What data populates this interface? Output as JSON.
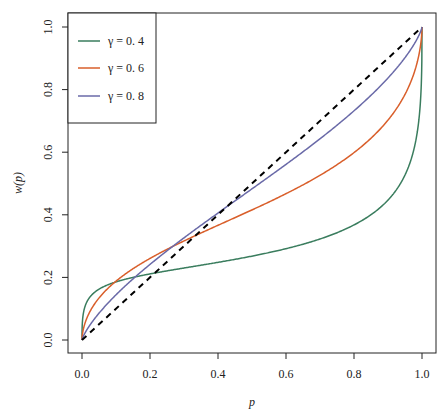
{
  "chart_data": {
    "type": "line",
    "title": "",
    "xlabel": "p",
    "ylabel": "w(p)",
    "xlim": [
      0,
      1
    ],
    "ylim": [
      0,
      1
    ],
    "grid": false,
    "legend_position": "top-left",
    "x_ticks": [
      "0.0",
      "0.2",
      "0.4",
      "0.6",
      "0.8",
      "1.0"
    ],
    "y_ticks": [
      "0.0",
      "0.2",
      "0.4",
      "0.6",
      "0.8",
      "1.0"
    ],
    "x": [
      0,
      0.01,
      0.02,
      0.05,
      0.1,
      0.15,
      0.2,
      0.3,
      0.4,
      0.5,
      0.6,
      0.7,
      0.8,
      0.9,
      0.95,
      0.98,
      0.99,
      1.0
    ],
    "series": [
      {
        "name": "γ = 0. 4",
        "color": "#3a7d5e",
        "style": "solid",
        "values": [
          0,
          0.111,
          0.132,
          0.162,
          0.186,
          0.2,
          0.211,
          0.23,
          0.248,
          0.268,
          0.292,
          0.323,
          0.368,
          0.447,
          0.527,
          0.627,
          0.696,
          1.0
        ]
      },
      {
        "name": "γ = 0. 6",
        "color": "#d95f2b",
        "style": "solid",
        "values": [
          0,
          0.0575,
          0.085,
          0.134,
          0.188,
          0.228,
          0.261,
          0.317,
          0.366,
          0.416,
          0.467,
          0.526,
          0.599,
          0.703,
          0.785,
          0.865,
          0.906,
          1.0
        ]
      },
      {
        "name": "γ = 0. 8",
        "color": "#6a6aa8",
        "style": "solid",
        "values": [
          0,
          0.0246,
          0.045,
          0.0855,
          0.144,
          0.194,
          0.241,
          0.327,
          0.406,
          0.483,
          0.561,
          0.643,
          0.732,
          0.837,
          0.902,
          0.95,
          0.971,
          1.0
        ]
      },
      {
        "name": "diagonal",
        "color": "#000000",
        "style": "dashed",
        "values": [
          0,
          0.01,
          0.02,
          0.05,
          0.1,
          0.15,
          0.2,
          0.3,
          0.4,
          0.5,
          0.6,
          0.7,
          0.8,
          0.9,
          0.95,
          0.98,
          0.99,
          1.0
        ]
      }
    ]
  },
  "legend": {
    "items": [
      {
        "label": "γ = 0. 4",
        "color": "#3a7d5e"
      },
      {
        "label": "γ = 0. 6",
        "color": "#d95f2b"
      },
      {
        "label": "γ = 0. 8",
        "color": "#6a6aa8"
      }
    ]
  },
  "axes": {
    "xlabel": "p",
    "ylabel": "w(p)"
  }
}
